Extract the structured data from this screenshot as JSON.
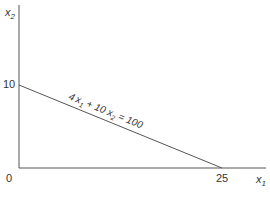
{
  "diagram": {
    "y_axis_label": "x",
    "y_axis_sub": "2",
    "x_axis_label": "x",
    "x_axis_sub": "1",
    "origin_label": "0",
    "y_intercept_label": "10",
    "x_intercept_label": "25",
    "equation": {
      "a": "4",
      "v1": "x",
      "s1": "1",
      "plus": " + 10 ",
      "v2": "x",
      "s2": "2",
      "rhs": " = 100"
    },
    "line_color": "#555555"
  }
}
